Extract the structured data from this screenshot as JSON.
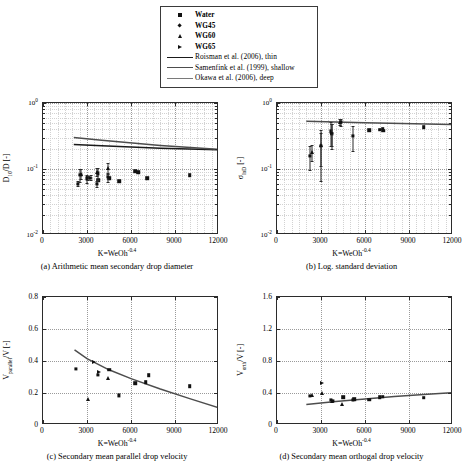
{
  "legend": {
    "entries": [
      {
        "label": "Water",
        "marker": "square"
      },
      {
        "label": "WG45",
        "marker": "diamond"
      },
      {
        "label": "WG60",
        "marker": "triangle-up"
      },
      {
        "label": "WG65",
        "marker": "triangle-right"
      },
      {
        "label": "Roisman et al. (2006), thin",
        "marker": "line",
        "color": "#1a1a1a"
      },
      {
        "label": "Samenfink et al. (1999), shallow",
        "marker": "line",
        "color": "#4d4d4d"
      },
      {
        "label": "Okawa et al. (2006), deep",
        "marker": "line",
        "color": "#7a7a7a"
      }
    ]
  },
  "captions": {
    "a": "(a) Arithmetic mean secondary drop diameter",
    "b": "(b) Log. standard deviation",
    "c": "(c) Secondary mean parallel drop velocity",
    "d": "(d) Secondary mean orthogal drop velocity"
  },
  "axes": {
    "xlabel_text": "K=WeOh",
    "xlabel_exp": "-0.4",
    "xticks": [
      "0",
      "3000",
      "6000",
      "9000",
      "12000"
    ],
    "xlim": [
      0,
      12000
    ],
    "log_yticks": [
      "10<sup>0</sup>",
      "10<sup>-1</sup>",
      "10<sup>-2</sup>"
    ],
    "c_yticks": [
      "0.8",
      "0.6",
      "0.4",
      "0.2",
      "0"
    ],
    "d_yticks": [
      "1.6",
      "1.2",
      "0.8",
      "0.4",
      "0"
    ]
  },
  "chart_data": [
    {
      "id": "a",
      "type": "scatter",
      "title": "(a) Arithmetic mean secondary drop diameter",
      "xlabel": "K=WeOh^-0.4",
      "ylabel": "D10/D [-]",
      "xlim": [
        0,
        12000
      ],
      "ylim": [
        0.01,
        1
      ],
      "yscale": "log",
      "grid": true,
      "series": [
        {
          "name": "Water",
          "marker": "square",
          "points": [
            [
              3750,
              0.068
            ],
            [
              4500,
              0.073
            ],
            [
              5200,
              0.065
            ],
            [
              6300,
              0.092
            ],
            [
              6500,
              0.09
            ],
            [
              7100,
              0.073
            ],
            [
              10000,
              0.08
            ]
          ],
          "errors": [
            0,
            0,
            0,
            0,
            0,
            0,
            0
          ]
        },
        {
          "name": "WG45",
          "marker": "diamond",
          "points": [
            [
              2400,
              0.06
            ],
            [
              2550,
              0.082
            ],
            [
              3000,
              0.072
            ],
            [
              3700,
              0.06
            ],
            [
              3750,
              0.086
            ],
            [
              4400,
              0.075
            ]
          ],
          "errors": [
            0.005,
            0.018,
            0.01,
            0.006,
            0.018,
            0.012
          ]
        },
        {
          "name": "WG60",
          "marker": "triangle-up",
          "points": [
            [
              2600,
              0.085
            ],
            [
              3700,
              0.09
            ],
            [
              4450,
              0.104
            ]
          ],
          "errors": [
            0.014,
            0.012,
            0.02
          ]
        },
        {
          "name": "WG65",
          "marker": "triangle-right",
          "points": [
            [
              3100,
              0.073
            ],
            [
              3300,
              0.074
            ]
          ],
          "errors": [
            0.006,
            0.006
          ]
        }
      ],
      "curves": [
        {
          "name": "Roisman et al. (2006), thin",
          "color": "#1a1a1a",
          "points": [
            [
              2100,
              0.235
            ],
            [
              4000,
              0.225
            ],
            [
              8000,
              0.207
            ],
            [
              12000,
              0.195
            ]
          ]
        },
        {
          "name": "Samenfink et al. (1999), shallow",
          "color": "#4d4d4d",
          "points": [
            [
              2100,
              0.3
            ],
            [
              4000,
              0.272
            ],
            [
              8000,
              0.228
            ],
            [
              12000,
              0.198
            ]
          ]
        }
      ]
    },
    {
      "id": "b",
      "type": "scatter",
      "title": "(b) Log. standard deviation",
      "xlabel": "K=WeOh^-0.4",
      "ylabel": "sigma_lnD [-]",
      "xlim": [
        0,
        12000
      ],
      "ylim": [
        0.01,
        1
      ],
      "yscale": "log",
      "grid": true,
      "series": [
        {
          "name": "Water",
          "marker": "square",
          "points": [
            [
              6300,
              0.385
            ],
            [
              7000,
              0.395
            ],
            [
              7200,
              0.41
            ],
            [
              7250,
              0.38
            ],
            [
              10000,
              0.43
            ]
          ],
          "errors": [
            0,
            0,
            0,
            0,
            0
          ]
        },
        {
          "name": "WG45",
          "marker": "diamond",
          "points": [
            [
              2250,
              0.16
            ],
            [
              3000,
              0.225
            ],
            [
              3700,
              0.37
            ],
            [
              3750,
              0.34
            ],
            [
              4350,
              0.51
            ],
            [
              5200,
              0.32
            ]
          ],
          "errors": [
            0.065,
            0.16,
            0.15,
            0.14,
            0.06,
            0.13
          ]
        },
        {
          "name": "WG60",
          "marker": "triangle-up",
          "points": [
            [
              2400,
              0.18
            ],
            [
              3000,
              0.23
            ],
            [
              4300,
              0.52
            ]
          ],
          "errors": [
            0.05,
            0.12,
            0.06
          ]
        },
        {
          "name": "WG65",
          "marker": "triangle-right",
          "points": [
            [
              3750,
              0.355
            ]
          ],
          "errors": [
            0.13
          ]
        }
      ],
      "curves": [
        {
          "name": "Okawa et al. (2006), deep",
          "color": "#4d4d4d",
          "points": [
            [
              2000,
              0.53
            ],
            [
              6000,
              0.5
            ],
            [
              12000,
              0.47
            ]
          ]
        }
      ]
    },
    {
      "id": "c",
      "type": "scatter",
      "title": "(c) Secondary mean parallel drop velocity",
      "xlabel": "K=WeOh^-0.4",
      "ylabel": "V_parallel/V [-]",
      "xlim": [
        0,
        12000
      ],
      "ylim": [
        0,
        0.8
      ],
      "yscale": "linear",
      "grid": true,
      "series": [
        {
          "name": "Water",
          "marker": "square",
          "points": [
            [
              4500,
              0.345
            ],
            [
              6300,
              0.262
            ],
            [
              7000,
              0.267
            ],
            [
              7200,
              0.312
            ],
            [
              10000,
              0.243
            ]
          ]
        },
        {
          "name": "WG45",
          "marker": "diamond",
          "points": [
            [
              2250,
              0.35
            ],
            [
              3750,
              0.315
            ],
            [
              5200,
              0.185
            ]
          ]
        },
        {
          "name": "WG60",
          "marker": "triangle-up",
          "points": [
            [
              3050,
              0.16
            ],
            [
              4450,
              0.292
            ]
          ]
        },
        {
          "name": "WG65",
          "marker": "triangle-right",
          "points": [
            [
              3500,
              0.395
            ],
            [
              3800,
              0.33
            ]
          ]
        }
      ],
      "curves": [
        {
          "name": "model",
          "color": "#4d4d4d",
          "points": [
            [
              2150,
              0.47
            ],
            [
              3000,
              0.415
            ],
            [
              4500,
              0.345
            ],
            [
              6000,
              0.29
            ],
            [
              8000,
              0.225
            ],
            [
              10000,
              0.165
            ],
            [
              11900,
              0.11
            ]
          ]
        }
      ]
    },
    {
      "id": "d",
      "type": "scatter",
      "title": "(d) Secondary mean orthogal drop velocity",
      "xlabel": "K=WeOh^-0.4",
      "ylabel": "V_orth/V [-]",
      "xlim": [
        0,
        12000
      ],
      "ylim": [
        0,
        1.6
      ],
      "yscale": "linear",
      "grid": true,
      "series": [
        {
          "name": "Water",
          "marker": "square",
          "points": [
            [
              4500,
              0.345
            ],
            [
              5250,
              0.32
            ],
            [
              6300,
              0.315
            ],
            [
              7000,
              0.345
            ],
            [
              7200,
              0.355
            ],
            [
              10000,
              0.34
            ]
          ]
        },
        {
          "name": "WG45",
          "marker": "diamond",
          "points": [
            [
              2250,
              0.36
            ],
            [
              3700,
              0.31
            ],
            [
              3800,
              0.305
            ],
            [
              5200,
              0.31
            ]
          ]
        },
        {
          "name": "WG60",
          "marker": "triangle-up",
          "points": [
            [
              2400,
              0.375
            ],
            [
              3050,
              0.4
            ],
            [
              3750,
              0.305
            ],
            [
              4450,
              0.265
            ]
          ]
        },
        {
          "name": "WG65",
          "marker": "triangle-right",
          "points": [
            [
              3100,
              0.52
            ]
          ]
        }
      ],
      "curves": [
        {
          "name": "model",
          "color": "#4d4d4d",
          "points": [
            [
              2000,
              0.255
            ],
            [
              4000,
              0.295
            ],
            [
              6000,
              0.325
            ],
            [
              8000,
              0.355
            ],
            [
              10000,
              0.38
            ],
            [
              12000,
              0.405
            ]
          ]
        }
      ]
    }
  ]
}
